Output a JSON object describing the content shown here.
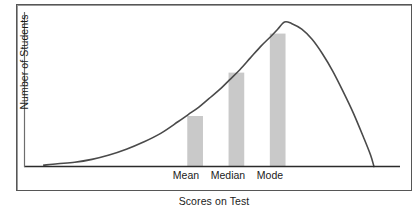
{
  "chart_data": {
    "type": "line",
    "title": "",
    "subtitle": "",
    "xlabel": "Scores on Test",
    "ylabel": "Number of Students",
    "grid": false,
    "legend": "none",
    "annotations": [
      "Mean",
      "Median",
      "Mode"
    ],
    "axis_ranges": {
      "xlim": [
        0,
        100
      ],
      "ylim": [
        0,
        100
      ]
    },
    "curve": {
      "name": "Distribution of scores",
      "skew": "left",
      "peak": {
        "x": 74,
        "y": 100
      },
      "color": "#4a4a4a",
      "x": [
        4,
        8,
        13,
        18,
        23,
        28,
        33,
        38,
        43,
        46,
        49,
        52,
        55,
        58,
        61,
        64,
        67,
        70,
        72,
        74,
        76,
        79,
        82,
        85,
        88,
        91,
        94,
        97,
        99,
        100
      ],
      "y": [
        1,
        2,
        3,
        5,
        8,
        12,
        17,
        23,
        31,
        36,
        41,
        47,
        53,
        60,
        67,
        75,
        83,
        90,
        95,
        100,
        99,
        95,
        88,
        78,
        66,
        52,
        37,
        20,
        8,
        0
      ]
    },
    "bars": [
      {
        "label": "Mean",
        "x": 48,
        "value": 35,
        "color": "#c9c9c9"
      },
      {
        "label": "Median",
        "x": 60,
        "value": 65,
        "color": "#c9c9c9"
      },
      {
        "label": "Mode",
        "x": 72,
        "value": 92,
        "color": "#c9c9c9"
      }
    ]
  },
  "axes": {
    "y_axis_label": "Number of Students",
    "x_axis_label": "Scores on Test"
  },
  "bar_labels": {
    "mean": "Mean",
    "median": "Median",
    "mode": "Mode"
  },
  "colors": {
    "bar_fill": "#c9c9c9",
    "curve": "#4a4a4a",
    "axis": "#2b2b2b",
    "frame": "#565656",
    "text": "#1b1b1b"
  }
}
